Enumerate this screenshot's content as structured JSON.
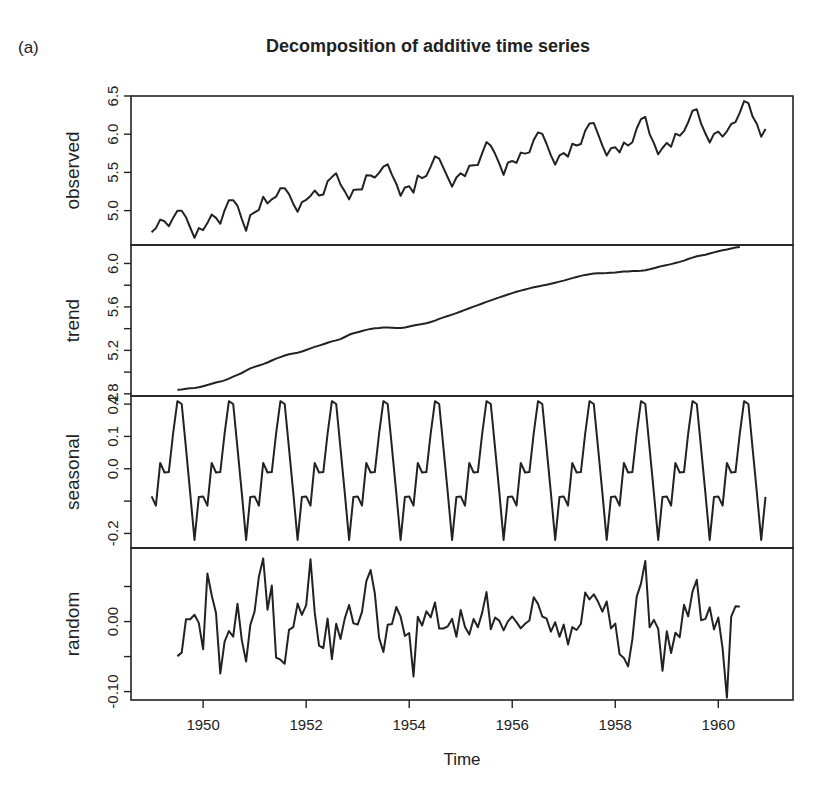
{
  "figure_label": "(a)",
  "chart_data": {
    "type": "line",
    "title": "Decomposition of additive time series",
    "xlabel": "Time",
    "x_start": 1949.0,
    "frequency": 12,
    "x_ticks": [
      1950,
      1952,
      1954,
      1956,
      1958,
      1960
    ],
    "x_tick_labels": [
      "1950",
      "1952",
      "1954",
      "1956",
      "1958",
      "1960"
    ],
    "xlim": [
      1948.6,
      1961.45
    ],
    "grid": false,
    "legend": null,
    "panels": [
      {
        "name": "observed",
        "ylabel": "observed",
        "ylim": [
          4.55,
          6.5
        ],
        "y_ticks": [
          5.0,
          5.5,
          6.0,
          6.5
        ],
        "y_tick_labels": [
          "5.0",
          "5.5",
          "6.0",
          "6.5"
        ],
        "y_minor_ticks": []
      },
      {
        "name": "trend",
        "ylabel": "trend",
        "ylim": [
          4.78,
          6.17
        ],
        "y_ticks": [
          4.8,
          5.0,
          5.2,
          5.4,
          5.6,
          5.8,
          6.0
        ],
        "y_tick_labels": [
          "4.8",
          "",
          "5.2",
          "",
          "5.6",
          "",
          "6.0"
        ]
      },
      {
        "name": "seasonal",
        "ylabel": "seasonal",
        "ylim": [
          -0.245,
          0.225
        ],
        "y_ticks": [
          -0.2,
          -0.1,
          0.0,
          0.1,
          0.2
        ],
        "y_tick_labels": [
          "-0.2",
          "",
          "0.0",
          "0.1",
          "0.2"
        ]
      },
      {
        "name": "random",
        "ylabel": "random",
        "ylim": [
          -0.112,
          0.105
        ],
        "y_ticks": [
          -0.1,
          -0.05,
          0.0,
          0.05
        ],
        "y_tick_labels": [
          "-0.10",
          "",
          "0.00",
          ""
        ]
      }
    ],
    "series": [
      {
        "name": "observed",
        "values": [
          4.718,
          4.771,
          4.883,
          4.86,
          4.796,
          4.905,
          4.997,
          4.997,
          4.913,
          4.779,
          4.644,
          4.771,
          4.745,
          4.836,
          4.949,
          4.905,
          4.828,
          5.004,
          5.136,
          5.136,
          5.063,
          4.89,
          4.736,
          4.942,
          4.977,
          5.011,
          5.182,
          5.094,
          5.148,
          5.182,
          5.293,
          5.293,
          5.215,
          5.088,
          4.984,
          5.112,
          5.142,
          5.193,
          5.263,
          5.198,
          5.209,
          5.384,
          5.438,
          5.489,
          5.342,
          5.252,
          5.147,
          5.268,
          5.278,
          5.278,
          5.464,
          5.46,
          5.434,
          5.493,
          5.576,
          5.606,
          5.468,
          5.352,
          5.193,
          5.303,
          5.318,
          5.236,
          5.46,
          5.425,
          5.455,
          5.576,
          5.71,
          5.68,
          5.557,
          5.434,
          5.313,
          5.434,
          5.489,
          5.451,
          5.587,
          5.595,
          5.598,
          5.753,
          5.897,
          5.849,
          5.743,
          5.613,
          5.468,
          5.628,
          5.649,
          5.624,
          5.759,
          5.746,
          5.762,
          5.924,
          6.023,
          6.004,
          5.872,
          5.724,
          5.602,
          5.724,
          5.753,
          5.707,
          5.875,
          5.852,
          5.872,
          6.045,
          6.142,
          6.146,
          6.001,
          5.849,
          5.72,
          5.817,
          5.829,
          5.762,
          5.892,
          5.852,
          5.894,
          6.075,
          6.196,
          6.225,
          6.001,
          5.883,
          5.737,
          5.82,
          5.886,
          5.835,
          6.006,
          5.981,
          6.04,
          6.157,
          6.306,
          6.326,
          6.138,
          6.009,
          5.892,
          6.004,
          6.033,
          5.969,
          6.038,
          6.133,
          6.157,
          6.282,
          6.433,
          6.407,
          6.23,
          6.133,
          5.966,
          6.068
        ]
      },
      {
        "name": "seasonal_figure",
        "months": [
          "Jan",
          "Feb",
          "Mar",
          "Apr",
          "May",
          "Jun",
          "Jul",
          "Aug",
          "Sep",
          "Oct",
          "Nov",
          "Dec"
        ],
        "values": [
          -0.0853,
          -0.114,
          0.0181,
          -0.0114,
          -0.0104,
          0.109,
          0.209,
          0.2002,
          0.063,
          -0.0756,
          -0.2201,
          -0.0869
        ]
      },
      {
        "name": "trend",
        "method": "centered 2x12 moving average of observed (undefined for first and last 6 months)"
      },
      {
        "name": "random",
        "method": "observed - trend - seasonal"
      }
    ]
  }
}
